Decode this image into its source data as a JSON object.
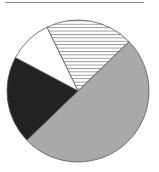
{
  "chart_data": {
    "type": "pie",
    "title": "",
    "start_angle_deg": 44,
    "direction": "counterclockwise",
    "categories": [
      "Hatched",
      "White",
      "Black",
      "Gray"
    ],
    "values": [
      20,
      10,
      20,
      50
    ],
    "fills": [
      "hatch",
      "#ffffff",
      "#222222",
      "#a9a9a9"
    ],
    "stroke": "#555555",
    "legend": "none",
    "grid": false
  },
  "layout": {
    "center": [
      78,
      91
    ],
    "radius": 71
  }
}
